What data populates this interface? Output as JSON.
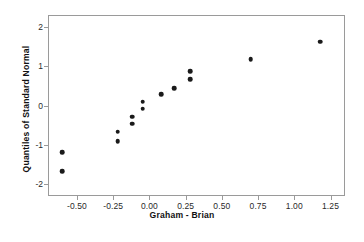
{
  "chart_data": {
    "type": "scatter",
    "title": "",
    "xlabel": "Graham - Brian",
    "ylabel": "Quantiles of Standard Normal",
    "xlim": [
      -0.7,
      1.35
    ],
    "ylim": [
      -2.3,
      2.3
    ],
    "grid": false,
    "legend": null,
    "xticks": [
      -0.5,
      -0.25,
      0.0,
      0.25,
      0.5,
      0.75,
      1.0,
      1.25
    ],
    "xticklabels": [
      "-0.50",
      "-0.25",
      "0.00",
      "0.25",
      "0.50",
      "0.75",
      "1.00",
      "1.25"
    ],
    "yticks": [
      -2,
      -1,
      0,
      1,
      2
    ],
    "yticklabels": [
      "-2",
      "-1",
      "0",
      "1",
      "2"
    ],
    "marker": {
      "shape": "circle",
      "color": "#1a1a1a",
      "size": 4.6
    },
    "points": [
      {
        "x": -0.6,
        "y": -1.18
      },
      {
        "x": -0.6,
        "y": -1.67
      },
      {
        "x": -0.22,
        "y": -0.67
      },
      {
        "x": -0.22,
        "y": -0.9
      },
      {
        "x": -0.12,
        "y": -0.28
      },
      {
        "x": -0.12,
        "y": -0.46
      },
      {
        "x": -0.045,
        "y": 0.1
      },
      {
        "x": -0.045,
        "y": -0.08
      },
      {
        "x": 0.08,
        "y": 0.28
      },
      {
        "x": 0.17,
        "y": 0.44
      },
      {
        "x": 0.28,
        "y": 0.87
      },
      {
        "x": 0.28,
        "y": 0.67
      },
      {
        "x": 0.7,
        "y": 1.18
      },
      {
        "x": 1.18,
        "y": 1.62
      }
    ]
  },
  "axes": {
    "x_title": "Graham - Brian",
    "y_title": "Quantiles of Standard Normal"
  },
  "colors": {
    "marker": "#1a1a1a",
    "frame": "#9a9a9a",
    "background": "#ffffff",
    "tick_text": "#2a2a2a"
  }
}
